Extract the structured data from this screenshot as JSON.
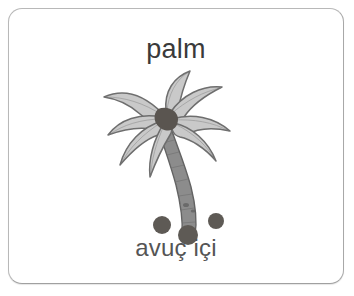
{
  "card": {
    "word_en": "palm",
    "word_tr": "avuç içi",
    "border_color": "#b8b8b8",
    "background_color": "#ffffff",
    "corner_radius_px": 14
  },
  "illustration": {
    "name": "palm-tree",
    "style": "grayscale-clipart",
    "frond_fill": "#c9c9c9",
    "frond_outline": "#6e6e6e",
    "trunk_fill": "#8c8c8c",
    "trunk_outline": "#636363",
    "crown_color": "#5a5550",
    "coconut_color": "#5e5a55",
    "frond_count": 7,
    "coconut_count": 3
  },
  "typography": {
    "top_text_color": "#3a3a3a",
    "bottom_text_color": "#555555"
  }
}
